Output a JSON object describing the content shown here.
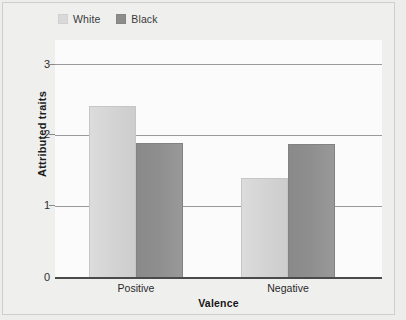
{
  "chart_data": {
    "type": "bar",
    "title": "",
    "subtitle": "",
    "xlabel": "Valence",
    "ylabel": "Attributed traits",
    "categories": [
      "Positive",
      "Negative"
    ],
    "series": [
      {
        "name": "White",
        "values": [
          2.42,
          1.41
        ],
        "color": "#d4d4d4"
      },
      {
        "name": "Black",
        "values": [
          1.9,
          1.89
        ],
        "color": "#8e8e8e"
      }
    ],
    "ylim": [
      0,
      3.35
    ],
    "yticks": [
      "0",
      "1",
      "2",
      "3"
    ],
    "ytick_values": [
      0,
      1,
      2,
      3
    ],
    "grid": "horizontal",
    "legend_position": "top-left",
    "grouping": "grouped",
    "background_color": "#ededec",
    "plot_background_color": "#fbfbfb",
    "gridline_color": "#9a9a9a",
    "axis_color": "#4a4a4a"
  },
  "legend": {
    "entries": [
      {
        "label": "White",
        "swatch": "white-swatch"
      },
      {
        "label": "Black",
        "swatch": "black-swatch"
      }
    ]
  },
  "axes": {
    "y_title": "Attributed traits",
    "x_title": "Valence",
    "y_tick_labels": [
      "3",
      "2",
      "1",
      "0"
    ],
    "x_tick_labels": [
      "Positive",
      "Negative"
    ]
  }
}
